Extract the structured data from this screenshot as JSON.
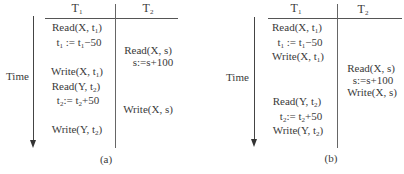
{
  "diagrams": [
    {
      "id": "a",
      "caption": "(a)",
      "time_label": "Time",
      "columns": [
        "T1",
        "T2"
      ],
      "t1_ops": [
        {
          "pre": "Read(X, t",
          "sub": "1",
          "post": ")"
        },
        {
          "pre": "t",
          "sub": "1",
          "mid": " := t",
          "sub2": "1",
          "post": "−50"
        },
        {
          "pre": "Write(X, t",
          "sub": "1",
          "post": ")"
        },
        {
          "pre": "Read(Y, t",
          "sub": "2",
          "post": ")"
        },
        {
          "pre": "t",
          "sub": "2",
          "mid": ":= t",
          "sub2": "2",
          "post": "+50"
        },
        {
          "pre": "Write(Y, t",
          "sub": "2",
          "post": ")"
        }
      ],
      "t2_ops": [
        {
          "text": "Read(X, s)"
        },
        {
          "text": "s:=s+100"
        },
        {
          "text": "Write(X, s)"
        }
      ]
    },
    {
      "id": "b",
      "caption": "(b)",
      "time_label": "Time",
      "columns": [
        "T1",
        "T2"
      ],
      "t1_ops": [
        {
          "pre": "Read(X, t",
          "sub": "1",
          "post": ")"
        },
        {
          "pre": "t",
          "sub": "1",
          "mid": " := t",
          "sub2": "1",
          "post": "−50"
        },
        {
          "pre": "Write(X, t",
          "sub": "1",
          "post": ")"
        },
        {
          "pre": "Read(Y, t",
          "sub": "2",
          "post": ")"
        },
        {
          "pre": "t",
          "sub": "2",
          "mid": ":= t",
          "sub2": "2",
          "post": "+50"
        },
        {
          "pre": "Write(Y, t",
          "sub": "2",
          "post": ")"
        }
      ],
      "t2_ops": [
        {
          "text": "Read(X, s)"
        },
        {
          "text": "s:=s+100"
        },
        {
          "text": "Write(X, s)"
        }
      ]
    }
  ],
  "header_labels": {
    "t": "T",
    "sub1": "1",
    "sub2": "2"
  }
}
